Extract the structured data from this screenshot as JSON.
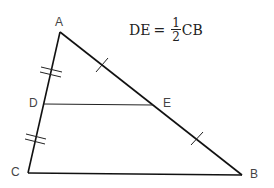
{
  "diagram": {
    "type": "triangle-midpoint-theorem",
    "formula": {
      "lhs": "DE",
      "equals": "=",
      "numerator": "1",
      "denominator": "2",
      "rhs": "CB"
    },
    "points": {
      "A": {
        "label": "A",
        "x": 60,
        "y": 32
      },
      "B": {
        "label": "B",
        "x": 242,
        "y": 175
      },
      "C": {
        "label": "C",
        "x": 28,
        "y": 173
      },
      "D": {
        "label": "D",
        "x": 44,
        "y": 104
      },
      "E": {
        "label": "E",
        "x": 153,
        "y": 105
      }
    },
    "segments": [
      "AB",
      "BC",
      "CA",
      "DE"
    ],
    "tick_marks": {
      "AD": 2,
      "DC": 2,
      "AE": 1,
      "EB": 1
    },
    "colors": {
      "line": "#111111",
      "label": "#444444",
      "background": "#ffffff"
    }
  }
}
